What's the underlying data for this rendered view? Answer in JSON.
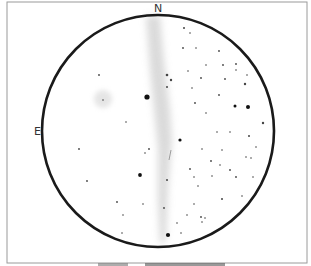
{
  "sketch": {
    "type": "eyepiece observation drawing",
    "frame": {
      "x": 7,
      "y": 2,
      "width": 300,
      "height": 261,
      "stroke": "#9a9a9a"
    },
    "field_circle": {
      "cx": 158,
      "cy": 131,
      "r": 116,
      "stroke": "#1a1a1a",
      "stroke_width": 2.6
    },
    "compass": {
      "north_label": "N",
      "east_label": "E"
    },
    "milky_way_band": {
      "color": "#c9c9c9"
    },
    "nebula_glow": {
      "cx": 103,
      "cy": 99,
      "r": 10
    },
    "streak": {
      "x1": 171,
      "y1": 150,
      "x2": 169,
      "y2": 160
    },
    "stars": [
      [
        184,
        28,
        1.0
      ],
      [
        190,
        33,
        0.8
      ],
      [
        183,
        48,
        0.9
      ],
      [
        196,
        48,
        0.8
      ],
      [
        219,
        51,
        0.9
      ],
      [
        99,
        75,
        0.9
      ],
      [
        167,
        75,
        1.3
      ],
      [
        171,
        80,
        1.2
      ],
      [
        167,
        87,
        1.0
      ],
      [
        188,
        71,
        0.8
      ],
      [
        206,
        65,
        0.8
      ],
      [
        223,
        65,
        0.9
      ],
      [
        236,
        64,
        0.9
      ],
      [
        236,
        70,
        0.8
      ],
      [
        201,
        78,
        0.9
      ],
      [
        225,
        79,
        0.9
      ],
      [
        247,
        75,
        0.8
      ],
      [
        245,
        84,
        1.2
      ],
      [
        192,
        88,
        0.8
      ],
      [
        219,
        95,
        0.9
      ],
      [
        147,
        97,
        2.6
      ],
      [
        103,
        100,
        0.8
      ],
      [
        195,
        103,
        0.9
      ],
      [
        206,
        113,
        0.8
      ],
      [
        235,
        106,
        1.5
      ],
      [
        248,
        107,
        2.0
      ],
      [
        126,
        122,
        0.8
      ],
      [
        217,
        132,
        0.8
      ],
      [
        230,
        132,
        0.8
      ],
      [
        263,
        123,
        1.2
      ],
      [
        249,
        136,
        1.0
      ],
      [
        180,
        140,
        1.6
      ],
      [
        79,
        149,
        0.9
      ],
      [
        149,
        149,
        0.9
      ],
      [
        145,
        153,
        0.8
      ],
      [
        202,
        149,
        0.8
      ],
      [
        222,
        150,
        0.8
      ],
      [
        256,
        147,
        0.8
      ],
      [
        211,
        161,
        0.9
      ],
      [
        251,
        158,
        0.8
      ],
      [
        246,
        157,
        0.8
      ],
      [
        220,
        165,
        0.8
      ],
      [
        190,
        169,
        0.9
      ],
      [
        230,
        170,
        0.9
      ],
      [
        140,
        175,
        1.9
      ],
      [
        167,
        180,
        1.0
      ],
      [
        212,
        176,
        0.8
      ],
      [
        194,
        177,
        0.8
      ],
      [
        236,
        177,
        0.9
      ],
      [
        87,
        181,
        0.9
      ],
      [
        253,
        177,
        0.8
      ],
      [
        198,
        186,
        0.8
      ],
      [
        222,
        199,
        1.0
      ],
      [
        242,
        196,
        0.8
      ],
      [
        117,
        202,
        0.9
      ],
      [
        143,
        204,
        0.8
      ],
      [
        164,
        208,
        0.9
      ],
      [
        194,
        204,
        0.8
      ],
      [
        187,
        215,
        0.8
      ],
      [
        123,
        215,
        0.8
      ],
      [
        201,
        217,
        0.9
      ],
      [
        205,
        218,
        0.8
      ],
      [
        202,
        222,
        0.8
      ],
      [
        177,
        223,
        0.8
      ],
      [
        122,
        233,
        0.8
      ],
      [
        168,
        235,
        2.1
      ],
      [
        181,
        233,
        0.8
      ]
    ]
  }
}
